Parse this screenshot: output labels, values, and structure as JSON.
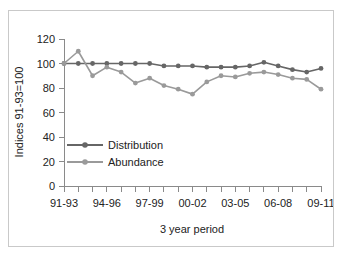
{
  "chart_data": {
    "type": "line",
    "title": "",
    "xlabel": "3 year period",
    "ylabel": "Indices 91-93=100",
    "ylim": [
      0,
      120
    ],
    "yticks": [
      0,
      20,
      40,
      60,
      80,
      100,
      120
    ],
    "grid": false,
    "legend_position": "inside-lower-left",
    "x_tick_labels": [
      "91-93",
      "94-96",
      "97-99",
      "00-02",
      "03-05",
      "06-08",
      "09-11"
    ],
    "x_tick_label_indices": [
      0,
      3,
      6,
      9,
      12,
      15,
      18
    ],
    "x": [
      "91-93",
      "92-94",
      "93-95",
      "94-96",
      "95-97",
      "96-98",
      "97-99",
      "98-00",
      "99-01",
      "00-02",
      "01-03",
      "02-04",
      "03-05",
      "04-06",
      "05-07",
      "06-08",
      "07-09",
      "08-10",
      "09-11"
    ],
    "series": [
      {
        "name": "Distribution",
        "color": "#666666",
        "marker": "circle",
        "values": [
          100,
          100,
          100,
          100,
          100,
          100,
          100,
          98,
          98,
          98,
          97,
          97,
          97,
          98,
          101,
          98,
          95,
          93,
          96
        ]
      },
      {
        "name": "Abundance",
        "color": "#9a9a9a",
        "marker": "circle",
        "values": [
          100,
          110,
          90,
          97,
          93,
          84,
          88,
          82,
          79,
          75,
          85,
          90,
          89,
          92,
          93,
          91,
          88,
          87,
          79
        ]
      }
    ]
  },
  "axes": {
    "y_axis_title": "Indices 91-93=100",
    "x_axis_title": "3 year period"
  },
  "legend": {
    "items": [
      {
        "label": "Distribution",
        "color": "#666666"
      },
      {
        "label": "Abundance",
        "color": "#9a9a9a"
      }
    ]
  }
}
